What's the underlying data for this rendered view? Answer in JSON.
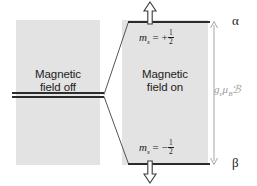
{
  "figure": {
    "name": "zeeman-splitting-diagram",
    "background_color": "#ffffff",
    "panel_color": "#e3e3e3",
    "level_color": "#2b2b2b",
    "gap_label_color": "#9a9a9a"
  },
  "panels": {
    "left": {
      "label": "Magnetic\nfield off",
      "name": "magnetic-field-off"
    },
    "right": {
      "label": "Magnetic\nfield on",
      "name": "magnetic-field-on"
    }
  },
  "levels": {
    "degenerate": {
      "name": "degenerate-level",
      "label": ""
    },
    "upper": {
      "name": "alpha-level",
      "quantum_number_label": "m_s = +1/2",
      "ms_symbol": "m",
      "ms_subscript": "s",
      "ms_relation": "= +",
      "ms_numerator": "1",
      "ms_denominator": "2",
      "state_label": "α",
      "spin_direction": "up"
    },
    "lower": {
      "name": "beta-level",
      "quantum_number_label": "m_s = −1/2",
      "ms_symbol": "m",
      "ms_subscript": "s",
      "ms_relation": "= −",
      "ms_numerator": "1",
      "ms_denominator": "2",
      "state_label": "β",
      "spin_direction": "down"
    }
  },
  "energy_gap": {
    "name": "energy-gap-annotation",
    "g_symbol": "g",
    "g_subscript": "e",
    "mu_symbol": "μ",
    "mu_subscript": "B",
    "field_symbol": "ℬ",
    "full_label": "gₑμʙℬ"
  }
}
